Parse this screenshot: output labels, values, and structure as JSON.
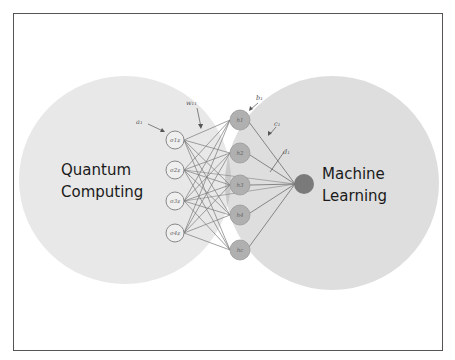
{
  "diagram": {
    "left_region": {
      "label_line1": "Quantum",
      "label_line2": "Computing",
      "color": "#e6e6e6"
    },
    "right_region": {
      "label_line1": "Machine",
      "label_line2": "Learning",
      "color": "#dcdcdc"
    },
    "input_nodes": [
      "σ1z",
      "σ2z",
      "σ3z",
      "σ4z"
    ],
    "hidden_nodes": [
      "h1",
      "h2",
      "h3",
      "h4",
      "hc"
    ],
    "output_node": "",
    "parameter_labels": {
      "input_bias": "a₁",
      "weight": "w₁₁",
      "hidden_bias": "b₁",
      "c": "c₁",
      "d": "d₁"
    },
    "colors": {
      "input_node_fill": "#eeeeee",
      "input_node_stroke": "#888888",
      "hidden_node_fill": "#b3b3b3",
      "output_node_fill": "#7a7a7a",
      "edge": "#777777",
      "overlap": "#cccccc"
    }
  }
}
